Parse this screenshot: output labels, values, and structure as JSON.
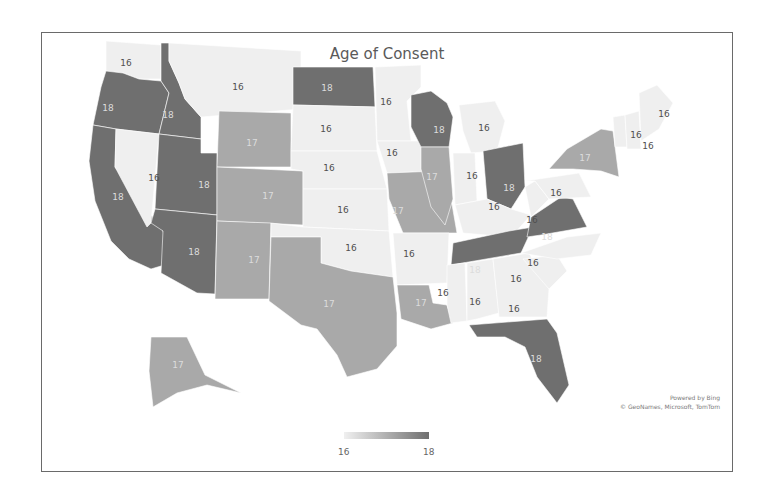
{
  "chart": {
    "title": "Age of Consent",
    "attribution_line1": "Powered by Bing",
    "attribution_line2": "© GeoNames, Microsoft, TomTom",
    "legend": {
      "min_label": "16",
      "max_label": "18",
      "min_color": "#f0f0f0",
      "max_color": "#6f6f6f"
    }
  },
  "colors": {
    "16": "#efefef",
    "17": "#a9a9a9",
    "18": "#6f6f6f",
    "text_light": "#dcdcdc",
    "text_dark": "#505050"
  },
  "chart_data": {
    "type": "choropleth",
    "title": "Age of Consent",
    "legend": {
      "min": 16,
      "max": 18,
      "position": "bottom-center"
    },
    "regions": [
      {
        "state": "Washington",
        "value": 16
      },
      {
        "state": "Oregon",
        "value": 18
      },
      {
        "state": "California",
        "value": 18
      },
      {
        "state": "Idaho",
        "value": 18
      },
      {
        "state": "Nevada",
        "value": 16
      },
      {
        "state": "Utah",
        "value": 18
      },
      {
        "state": "Arizona",
        "value": 18
      },
      {
        "state": "Montana",
        "value": 16
      },
      {
        "state": "Wyoming",
        "value": 17
      },
      {
        "state": "Colorado",
        "value": 17
      },
      {
        "state": "New Mexico",
        "value": 17
      },
      {
        "state": "North Dakota",
        "value": 18
      },
      {
        "state": "South Dakota",
        "value": 16
      },
      {
        "state": "Nebraska",
        "value": 16
      },
      {
        "state": "Kansas",
        "value": 16
      },
      {
        "state": "Oklahoma",
        "value": 16
      },
      {
        "state": "Texas",
        "value": 17
      },
      {
        "state": "Minnesota",
        "value": 16
      },
      {
        "state": "Iowa",
        "value": 16
      },
      {
        "state": "Missouri",
        "value": 17
      },
      {
        "state": "Arkansas",
        "value": 16
      },
      {
        "state": "Louisiana",
        "value": 17
      },
      {
        "state": "Wisconsin",
        "value": 18
      },
      {
        "state": "Illinois",
        "value": 17
      },
      {
        "state": "Michigan",
        "value": 16
      },
      {
        "state": "Indiana",
        "value": 16
      },
      {
        "state": "Ohio",
        "value": 18
      },
      {
        "state": "Kentucky",
        "value": 16
      },
      {
        "state": "Tennessee",
        "value": 18
      },
      {
        "state": "Mississippi",
        "value": 16
      },
      {
        "state": "Alabama",
        "value": 16
      },
      {
        "state": "Georgia",
        "value": 16
      },
      {
        "state": "Florida",
        "value": 18
      },
      {
        "state": "South Carolina",
        "value": 16
      },
      {
        "state": "North Carolina",
        "value": 16
      },
      {
        "state": "Virginia",
        "value": 18
      },
      {
        "state": "West Virginia",
        "value": 16
      },
      {
        "state": "Pennsylvania",
        "value": 16
      },
      {
        "state": "New York",
        "value": 17
      },
      {
        "state": "Vermont",
        "value": 16
      },
      {
        "state": "New Hampshire",
        "value": 16
      },
      {
        "state": "Maine",
        "value": 16
      },
      {
        "state": "Alaska",
        "value": 17
      }
    ]
  },
  "map": {
    "states": [
      {
        "id": "WA",
        "value": 16,
        "lx": 125,
        "ly": 62,
        "pts": "105,40 160,44 160,78 138,78 122,72 105,72"
      },
      {
        "id": "OR",
        "value": 18,
        "lx": 107,
        "ly": 107,
        "pts": "105,70 122,72 138,78 160,80 168,92 158,133 115,128 92,124 100,86"
      },
      {
        "id": "CA",
        "value": 18,
        "lx": 117,
        "ly": 196,
        "pts": "92,124 115,128 114,166 162,230 170,262 150,268 128,258 110,240 94,200 88,160"
      },
      {
        "id": "ID",
        "value": 18,
        "lx": 167,
        "ly": 114,
        "pts": "160,42 168,42 168,60 178,82 184,98 200,116 200,138 158,133 168,92 160,80"
      },
      {
        "id": "NV",
        "value": 16,
        "lx": 153,
        "ly": 177,
        "pts": "115,128 158,133 150,222 146,226 114,166"
      },
      {
        "id": "UT",
        "value": 18,
        "lx": 203,
        "ly": 184,
        "pts": "158,133 200,138 200,152 216,152 216,214 154,208"
      },
      {
        "id": "AZ",
        "value": 18,
        "lx": 193,
        "ly": 251,
        "pts": "154,208 216,214 214,293 196,292 160,272 162,230 150,222"
      },
      {
        "id": "MT",
        "value": 16,
        "lx": 237,
        "ly": 86,
        "pts": "168,42 300,50 300,108 200,116 184,98 178,82 168,60"
      },
      {
        "id": "WY",
        "value": 17,
        "lx": 251,
        "ly": 142,
        "pts": "218,110 290,112 290,166 216,166"
      },
      {
        "id": "CO",
        "value": 17,
        "lx": 267,
        "ly": 195,
        "pts": "216,166 302,170 302,224 216,220"
      },
      {
        "id": "NM",
        "value": 17,
        "lx": 253,
        "ly": 259,
        "pts": "216,220 270,222 268,298 214,298"
      },
      {
        "id": "ND",
        "value": 18,
        "lx": 326,
        "ly": 87,
        "pts": "292,66 372,66 374,106 292,104"
      },
      {
        "id": "SD",
        "value": 16,
        "lx": 325,
        "ly": 128,
        "pts": "292,104 374,106 376,150 290,150"
      },
      {
        "id": "NE",
        "value": 16,
        "lx": 328,
        "ly": 167,
        "pts": "290,150 376,150 386,188 302,188 302,170 290,168"
      },
      {
        "id": "KS",
        "value": 16,
        "lx": 342,
        "ly": 209,
        "pts": "302,188 386,188 388,230 302,226"
      },
      {
        "id": "OK",
        "value": 16,
        "lx": 350,
        "ly": 247,
        "pts": "270,222 302,226 388,230 392,276 350,270 320,262 320,236 270,236"
      },
      {
        "id": "TX",
        "value": 17,
        "lx": 328,
        "ly": 303,
        "pts": "270,236 320,236 320,262 350,270 392,276 396,312 396,345 376,368 346,376 336,354 316,328 300,324 268,300"
      },
      {
        "id": "MN",
        "value": 16,
        "lx": 385,
        "ly": 101,
        "pts": "374,66 420,64 420,86 406,100 410,140 376,140"
      },
      {
        "id": "IA",
        "value": 16,
        "lx": 391,
        "ly": 152,
        "pts": "376,140 434,140 438,170 386,172"
      },
      {
        "id": "MO",
        "value": 17,
        "lx": 397,
        "ly": 210,
        "pts": "386,172 438,170 448,186 456,232 402,232 388,198"
      },
      {
        "id": "AR",
        "value": 16,
        "lx": 408,
        "ly": 253,
        "pts": "392,232 448,232 446,282 396,284"
      },
      {
        "id": "LA",
        "value": 17,
        "lx": 420,
        "ly": 302,
        "pts": "396,284 428,284 432,302 446,304 452,322 430,328 400,318"
      },
      {
        "id": "WI",
        "value": 18,
        "lx": 438,
        "ly": 129,
        "pts": "410,94 430,90 446,102 452,116 448,146 420,146 410,126"
      },
      {
        "id": "IL",
        "value": 17,
        "lx": 431,
        "ly": 176,
        "pts": "420,146 448,146 452,198 444,224 430,206 420,168"
      },
      {
        "id": "MI",
        "value": 16,
        "lx": 483,
        "ly": 127,
        "pts": "458,104 494,100 504,120 496,150 470,152 462,130"
      },
      {
        "id": "IN",
        "value": 16,
        "lx": 471,
        "ly": 175,
        "pts": "452,152 474,152 476,200 454,204"
      },
      {
        "id": "OH",
        "value": 18,
        "lx": 508,
        "ly": 187,
        "pts": "482,150 522,142 524,186 510,208 486,198"
      },
      {
        "id": "KY",
        "value": 16,
        "lx": 493,
        "ly": 206,
        "pts": "454,204 486,198 510,208 530,214 510,236 462,232"
      },
      {
        "id": "TN",
        "value": 18,
        "lx": 474,
        "ly": 269,
        "pts": "452,242 508,230 532,226 520,252 450,264"
      },
      {
        "id": "MS",
        "value": 16,
        "lx": 442,
        "ly": 292,
        "pts": "446,264 464,262 466,320 450,322 446,304"
      },
      {
        "id": "AL",
        "value": 16,
        "lx": 474,
        "ly": 301,
        "pts": "466,262 492,258 498,312 476,318 466,320"
      },
      {
        "id": "GA",
        "value": 16,
        "lx": 513,
        "ly": 308,
        "pts": "492,258 528,252 548,288 546,316 498,316"
      },
      {
        "id": "FL",
        "value": 18,
        "lx": 535,
        "ly": 358,
        "pts": "468,324 546,318 556,332 568,384 556,402 536,376 524,346 504,336 476,336"
      },
      {
        "id": "SC",
        "value": 16,
        "lx": 515,
        "ly": 278,
        "pts": "522,258 556,254 566,270 548,288"
      },
      {
        "id": "NC",
        "value": 16,
        "lx": 532,
        "ly": 262,
        "pts": "520,252 566,236 600,232 590,254 556,258"
      },
      {
        "id": "VA",
        "value": 18,
        "lx": 546,
        "ly": 236,
        "pts": "530,216 560,196 572,198 586,226 540,234 526,236"
      },
      {
        "id": "WV",
        "value": 16,
        "lx": 531,
        "ly": 219,
        "pts": "524,186 534,180 548,198 530,216"
      },
      {
        "id": "PA",
        "value": 16,
        "lx": 555,
        "ly": 192,
        "pts": "524,180 578,172 590,196 548,198 534,180"
      },
      {
        "id": "NY",
        "value": 17,
        "lx": 584,
        "ly": 157,
        "pts": "548,168 566,148 600,128 612,130 618,176 600,170 572,168"
      },
      {
        "id": "VT",
        "value": 16,
        "lx": 635,
        "ly": 134,
        "pts": "612,116 624,114 626,146 614,146"
      },
      {
        "id": "NH",
        "value": 16,
        "lx": 647,
        "ly": 145,
        "pts": "624,114 638,110 640,148 626,148"
      },
      {
        "id": "ME",
        "value": 16,
        "lx": 663,
        "ly": 113,
        "pts": "638,92 656,84 672,102 658,128 640,140"
      }
    ],
    "alaska": {
      "value": 17,
      "lx": 177,
      "ly": 364,
      "pts": "150,336 186,336 204,374 240,392 206,384 176,392 152,406 148,370"
    }
  }
}
